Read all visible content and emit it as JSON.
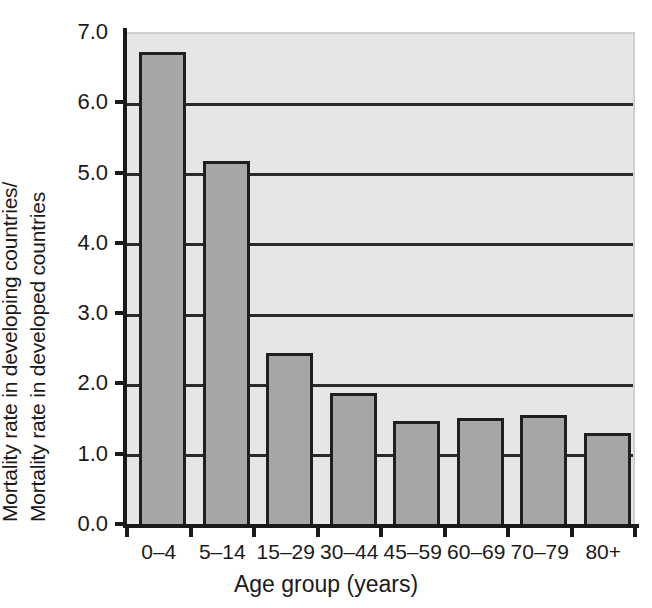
{
  "chart_data": {
    "type": "bar",
    "title": "",
    "subtitle": "",
    "categories": [
      "0–4",
      "5–14",
      "15–29",
      "30–44",
      "45–59",
      "60–69",
      "70–79",
      "80+"
    ],
    "values": [
      6.72,
      5.17,
      2.43,
      1.87,
      1.47,
      1.51,
      1.55,
      1.3
    ],
    "xlabel": "Age group (years)",
    "ylabel_line_1": "Mortality rate in developing countries/",
    "ylabel_line_2": "Mortality rate in developed countries",
    "ylim": [
      0.0,
      7.0
    ],
    "ytick_values": [
      7.0,
      6.0,
      5.0,
      4.0,
      3.0,
      2.0,
      1.0,
      0.0
    ],
    "ytick_labels": [
      "7.0",
      "6.0",
      "5.0",
      "4.0",
      "3.0",
      "2.0",
      "1.0",
      "0.0"
    ],
    "grid": "horizontal",
    "legend": "none",
    "colors": {
      "bar_fill": "#a6a6a6",
      "bar_edge": "#1f1f1f",
      "plot_background": "#e6e6e6",
      "gridline": "#2b2b2b",
      "axis": "#1a1a1a",
      "text": "#1a1a1a",
      "figure_background": "#ffffff"
    }
  }
}
